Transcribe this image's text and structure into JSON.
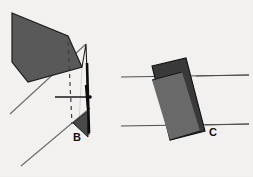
{
  "figure": {
    "background_color": "#f4f3f1",
    "width": 253,
    "height": 177,
    "panels": [
      {
        "id": "panel-b",
        "label": "B",
        "label_x": 73,
        "label_y": 141,
        "description": "Shaded quadrilateral plane intersecting a thin outlined wedge with a dashed vertical trace, a thick black vertical bar, a horizontal arrow marker and two parallel diagonal reference lines",
        "shaded_plane": {
          "fill": "#5a5a5a",
          "stroke": "#1a1a1a",
          "points": "12,13 68,36 82,67 28,82 12,62"
        },
        "wedge_outline": {
          "stroke": "#1a1a1a",
          "points": "82,67 86,44 89,134 79,124"
        },
        "wedge_tip": {
          "fill": "#4a4a4a",
          "stroke": "#1a1a1a",
          "points": "73,123 89,112 89,137"
        },
        "dashed_trace": {
          "stroke": "#3a3a3a",
          "x1": 68,
          "y1": 42,
          "x2": 72,
          "y2": 124,
          "dash": "4 4"
        },
        "thick_bar": {
          "fill": "#101010",
          "x1": 86,
          "y1": 63,
          "x2": 88,
          "y2": 132
        },
        "arrow_marker": {
          "stroke": "#1a1a1a",
          "x1": 55,
          "y1": 97,
          "x2": 90,
          "y2": 97,
          "tick_x": 86,
          "tick_top": 85,
          "tick_bottom": 110
        },
        "diagonal_lines": [
          {
            "x1": 10,
            "y1": 114,
            "x2": 86,
            "y2": 44
          },
          {
            "x1": 21,
            "y1": 166,
            "x2": 90,
            "y2": 108
          }
        ]
      },
      {
        "id": "panel-c",
        "label": "C",
        "label_x": 209,
        "label_y": 136,
        "description": "Dark parallelogram plane with a lighter diagonal band, crossed by two horizontal reference lines",
        "shaded_plane": {
          "fill": "#3a3a3a",
          "stroke": "#111111",
          "points": "152,66 186,58 205,131 170,140"
        },
        "band": {
          "fill": "#6a6a6a",
          "points": "152,80 182,72 199,131 170,140"
        },
        "reference_lines": [
          {
            "x1": 121,
            "y1": 77,
            "x2": 249,
            "y2": 75
          },
          {
            "x1": 121,
            "y1": 126,
            "x2": 249,
            "y2": 124
          }
        ]
      }
    ]
  }
}
